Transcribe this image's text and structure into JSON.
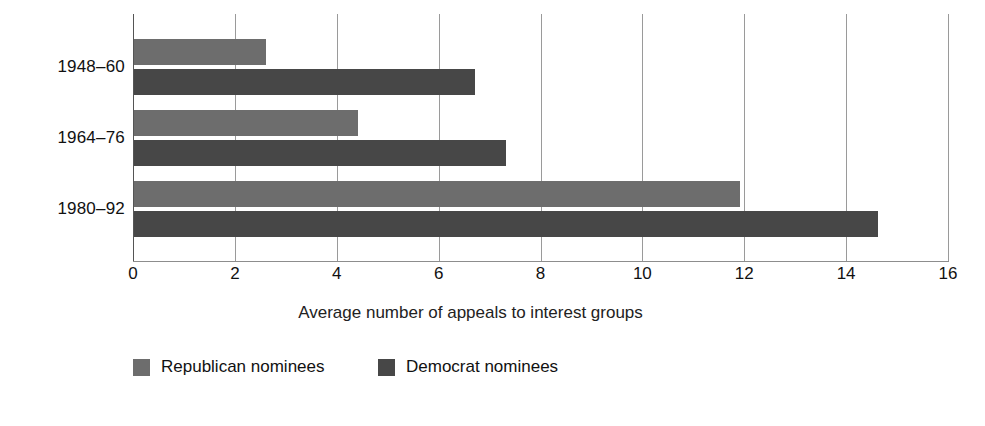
{
  "chart_data": {
    "type": "bar",
    "orientation": "horizontal",
    "title": "",
    "xlabel": "Average number of appeals to interest groups",
    "ylabel": "",
    "categories": [
      "1948–60",
      "1964–76",
      "1980–92"
    ],
    "series": [
      {
        "name": "Republican nominees",
        "color": "#6d6d6d",
        "values": [
          2.6,
          4.4,
          11.9
        ]
      },
      {
        "name": "Democrat nominees",
        "color": "#474747",
        "values": [
          6.7,
          7.3,
          14.6
        ]
      }
    ],
    "xlim": [
      0,
      16
    ],
    "xticks": [
      "0",
      "2",
      "4",
      "6",
      "8",
      "10",
      "12",
      "14",
      "16"
    ],
    "xtick_values": [
      0,
      2,
      4,
      6,
      8,
      10,
      12,
      14,
      16
    ],
    "grid": "vertical",
    "legend_position": "bottom-left"
  },
  "axis": {
    "title": "Average number of appeals to interest groups"
  },
  "ylabel_clipped": {
    "text": "l"
  },
  "legend": {
    "items": [
      {
        "label": "Republican nominees",
        "color": "#6d6d6d"
      },
      {
        "label": "Democrat nominees",
        "color": "#474747"
      }
    ]
  },
  "colors": {
    "republican": "#6d6d6d",
    "democrat": "#474747",
    "gridline": "#9a9a9a",
    "background": "#ffffff",
    "text": "#111111"
  }
}
